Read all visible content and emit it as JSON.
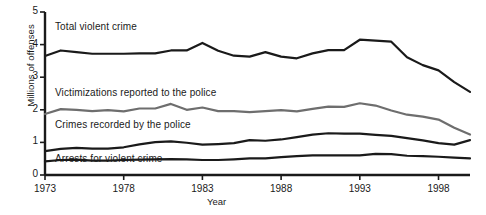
{
  "chart_data": {
    "type": "line",
    "title": "",
    "xlabel": "Year",
    "ylabel": "Millions of offenses",
    "xlim": [
      1973,
      2000
    ],
    "ylim": [
      0,
      5
    ],
    "grid": false,
    "legend_position": "inline-labels",
    "ytick_labels": [
      "0",
      "1",
      "2",
      "3",
      "4",
      "5"
    ],
    "ytick_values": [
      0,
      1,
      2,
      3,
      4,
      5
    ],
    "xtick_labels": [
      "1973",
      "1978",
      "1983",
      "1988",
      "1993",
      "1998"
    ],
    "xtick_values": [
      1973,
      1978,
      1983,
      1988,
      1993,
      1998
    ],
    "x": [
      1973,
      1974,
      1975,
      1976,
      1977,
      1978,
      1979,
      1980,
      1981,
      1982,
      1983,
      1984,
      1985,
      1986,
      1987,
      1988,
      1989,
      1990,
      1991,
      1992,
      1993,
      1994,
      1995,
      1996,
      1997,
      1998,
      1999,
      2000
    ],
    "series": [
      {
        "name": "Total violent crime",
        "color": "#1a1a1a",
        "label_x_px": 55,
        "label_y_px": 21,
        "values": [
          3.65,
          3.82,
          3.77,
          3.72,
          3.72,
          3.72,
          3.73,
          3.73,
          3.82,
          3.82,
          4.05,
          3.81,
          3.66,
          3.63,
          3.77,
          3.63,
          3.58,
          3.73,
          3.83,
          3.83,
          4.15,
          4.12,
          4.09,
          3.61,
          3.37,
          3.21,
          2.85,
          2.55
        ]
      },
      {
        "name": "Victimizations reported to the police",
        "color": "#6e6e6e",
        "label_x_px": 55,
        "label_y_px": 87,
        "values": [
          1.87,
          2.02,
          2.0,
          1.96,
          1.99,
          1.95,
          2.04,
          2.04,
          2.18,
          2.0,
          2.07,
          1.96,
          1.96,
          1.93,
          1.96,
          1.99,
          1.95,
          2.03,
          2.1,
          2.09,
          2.2,
          2.13,
          1.98,
          1.85,
          1.79,
          1.7,
          1.45,
          1.24
        ]
      },
      {
        "name": "Crimes recorded by the police",
        "color": "#1a1a1a",
        "label_x_px": 55,
        "label_y_px": 119,
        "values": [
          0.73,
          0.8,
          0.83,
          0.81,
          0.81,
          0.85,
          0.94,
          1.01,
          1.03,
          0.99,
          0.93,
          0.95,
          0.98,
          1.07,
          1.05,
          1.09,
          1.16,
          1.24,
          1.28,
          1.27,
          1.27,
          1.23,
          1.2,
          1.13,
          1.06,
          0.98,
          0.93,
          1.07
        ]
      },
      {
        "name": "Arrests for violent crime",
        "color": "#1a1a1a",
        "label_x_px": 55,
        "label_y_px": 153,
        "values": [
          0.42,
          0.46,
          0.47,
          0.44,
          0.44,
          0.46,
          0.47,
          0.48,
          0.49,
          0.48,
          0.46,
          0.46,
          0.48,
          0.51,
          0.51,
          0.55,
          0.58,
          0.6,
          0.6,
          0.6,
          0.6,
          0.65,
          0.64,
          0.59,
          0.58,
          0.56,
          0.53,
          0.51
        ]
      }
    ]
  },
  "axes": {
    "y_title": "Millions of offenses",
    "x_title": "Year"
  }
}
